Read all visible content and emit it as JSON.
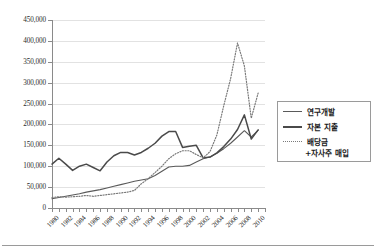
{
  "chart_data": {
    "type": "line",
    "title": "",
    "subtitle": "",
    "xlabel": "",
    "ylabel": "",
    "xlim": [
      1980,
      2011
    ],
    "ylim": [
      0,
      450000
    ],
    "grid": true,
    "legend_position": "right",
    "y_ticks": [
      "0",
      "50,000",
      "100,000",
      "150,000",
      "200,000",
      "250,000",
      "300,000",
      "350,000",
      "400,000",
      "450,000"
    ],
    "y_tick_values": [
      0,
      50000,
      100000,
      150000,
      200000,
      250000,
      300000,
      350000,
      400000,
      450000
    ],
    "x_tick_labels": [
      "1980",
      "1982",
      "1984",
      "1986",
      "1988",
      "1990",
      "1992",
      "1994",
      "1996",
      "1998",
      "2000",
      "2002",
      "2004",
      "2006",
      "2008",
      "2010"
    ],
    "x_minor_years": [
      1980,
      1981,
      1982,
      1983,
      1984,
      1985,
      1986,
      1987,
      1988,
      1989,
      1990,
      1991,
      1992,
      1993,
      1994,
      1995,
      1996,
      1997,
      1998,
      1999,
      2000,
      2001,
      2002,
      2003,
      2004,
      2005,
      2006,
      2007,
      2008,
      2009,
      2010,
      2011
    ],
    "x": [
      1980,
      1981,
      1982,
      1983,
      1984,
      1985,
      1986,
      1987,
      1988,
      1989,
      1990,
      1991,
      1992,
      1993,
      1994,
      1995,
      1996,
      1997,
      1998,
      1999,
      2000,
      2001,
      2002,
      2003,
      2004,
      2005,
      2006,
      2007,
      2008,
      2009,
      2010
    ],
    "series": [
      {
        "name": "연구개발",
        "style": "solid-thin",
        "color": "#5a5a5a",
        "values": [
          22000,
          25000,
          28000,
          31000,
          34000,
          38000,
          41000,
          44000,
          48000,
          52000,
          56000,
          60000,
          64000,
          67000,
          70000,
          78000,
          88000,
          98000,
          100000,
          100000,
          102000,
          110000,
          118000,
          122000,
          131000,
          142000,
          155000,
          170000,
          185000,
          170000,
          186000
        ]
      },
      {
        "name": "자본 지출",
        "style": "solid-thick",
        "color": "#4a4a4a",
        "values": [
          105000,
          119000,
          105000,
          90000,
          100000,
          105000,
          97000,
          89000,
          110000,
          125000,
          133000,
          133000,
          127000,
          133000,
          143000,
          155000,
          172000,
          183000,
          183000,
          145000,
          148000,
          150000,
          120000,
          122000,
          132000,
          147000,
          165000,
          188000,
          223000,
          165000,
          187000
        ]
      },
      {
        "name": "배당금 +자사주 매입",
        "style": "dotted",
        "color": "#7a7a7a",
        "values": [
          25000,
          27000,
          26000,
          27000,
          28000,
          30000,
          28000,
          30000,
          32000,
          34000,
          36000,
          38000,
          42000,
          58000,
          70000,
          85000,
          100000,
          118000,
          130000,
          137000,
          137000,
          128000,
          120000,
          135000,
          175000,
          245000,
          310000,
          395000,
          340000,
          215000,
          275000
        ]
      }
    ]
  },
  "legend": {
    "items": [
      {
        "label": "연구개발",
        "swatch": "solid-thin"
      },
      {
        "label": "자본 지출",
        "swatch": "solid-thick"
      },
      {
        "label": "배당금",
        "swatch": "dotted"
      }
    ],
    "third_item_line2": "+자사주 매입"
  }
}
